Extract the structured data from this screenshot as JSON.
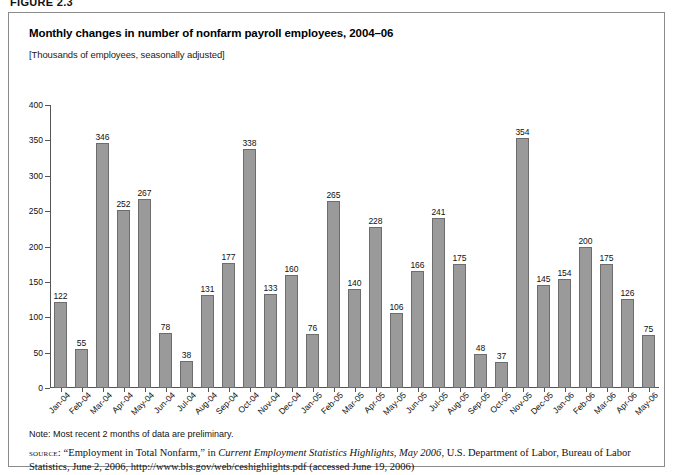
{
  "figure": {
    "label": "FIGURE 2.3"
  },
  "chart": {
    "title": "Monthly changes in number of nonfarm payroll employees, 2004–06",
    "subtitle": "[Thousands of employees, seasonally adjusted]"
  },
  "footnotes": {
    "note": "Note: Most recent 2 months of data are preliminary.",
    "source_tag": "source:",
    "source_part1": " “Employment in Total Nonfarm,” in ",
    "source_italic": "Current Employment Statistics Highlights, May 2006",
    "source_part2": ", U.S. Department of Labor, Bureau of Labor Statistics, June 2, 2006, http://www.bls.gov/web/ceshighlights.pdf (accessed June 19, 2006)"
  },
  "chart_data": {
    "type": "bar",
    "title": "Monthly changes in number of nonfarm payroll employees, 2004–06",
    "subtitle": "[Thousands of employees, seasonally adjusted]",
    "xlabel": "",
    "ylabel": "",
    "ylim": [
      0,
      400
    ],
    "yticks": [
      0,
      50,
      100,
      150,
      200,
      250,
      300,
      350,
      400
    ],
    "ytick_labels": [
      "0",
      "50",
      "100",
      "150",
      "200",
      "250",
      "300",
      "350",
      "400"
    ],
    "grid": false,
    "legend": false,
    "bar_color": "#9a9a9a",
    "bar_edge_color": "#6d6d6d",
    "show_value_labels": true,
    "categories": [
      "Jan-04",
      "Feb-04",
      "Mar-04",
      "Apr-04",
      "May-04",
      "Jun-04",
      "Jul-04",
      "Aug-04",
      "Sep-04",
      "Oct-04",
      "Nov-04",
      "Dec-04",
      "Jan-05",
      "Feb-05",
      "Mar-05",
      "Apr-05",
      "May-05",
      "Jun-05",
      "Jul-05",
      "Aug-05",
      "Sep-05",
      "Oct-05",
      "Nov-05",
      "Dec-05",
      "Jan-06",
      "Feb-06",
      "Mar-06",
      "Apr-06",
      "May-06"
    ],
    "values": [
      122,
      55,
      346,
      252,
      267,
      78,
      38,
      131,
      177,
      338,
      133,
      160,
      76,
      265,
      140,
      228,
      106,
      166,
      241,
      175,
      48,
      37,
      354,
      145,
      154,
      200,
      175,
      126,
      75
    ]
  }
}
